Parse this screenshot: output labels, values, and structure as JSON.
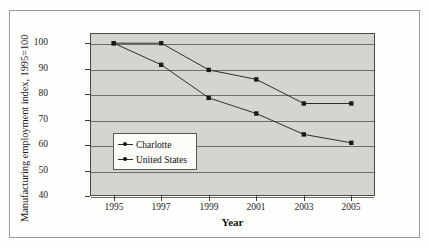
{
  "chart_data": {
    "type": "line",
    "title": "",
    "xlabel": "Year",
    "ylabel": "Manufacturing employment index, 1995=100",
    "x": [
      1995,
      1997,
      1999,
      2001,
      2003,
      2005
    ],
    "xtick_labels": [
      "1995",
      "1997",
      "1999",
      "2001",
      "2003",
      "2005"
    ],
    "ytick_labels": [
      "40",
      "50",
      "60",
      "70",
      "80",
      "90",
      "100"
    ],
    "ylim": [
      40,
      104
    ],
    "xlim": [
      1994,
      2006
    ],
    "grid": "horizontal",
    "legend_position": "inner-left-lower",
    "series": [
      {
        "name": "Charlotte",
        "color": "#1a1a18",
        "marker": "filled-square",
        "values": [
          100,
          100,
          89.5,
          85.8,
          76.3,
          76.3
        ]
      },
      {
        "name": "United States",
        "color": "#1a1a18",
        "marker": "filled-square",
        "values": [
          100,
          91.5,
          78.5,
          72.4,
          64.2,
          60.9
        ]
      }
    ]
  },
  "legend": {
    "items": [
      {
        "label": "Charlotte"
      },
      {
        "label": "United States"
      }
    ]
  },
  "axes": {
    "y_title": "Manufacturing employment index, 1995=100",
    "x_title": "Year"
  },
  "colors": {
    "plot_background": "#d6d4cf",
    "gridline": "#6e6e68",
    "axis": "#3c3c38",
    "series": "#1a1a18",
    "page_background": "#fdfdfb"
  }
}
